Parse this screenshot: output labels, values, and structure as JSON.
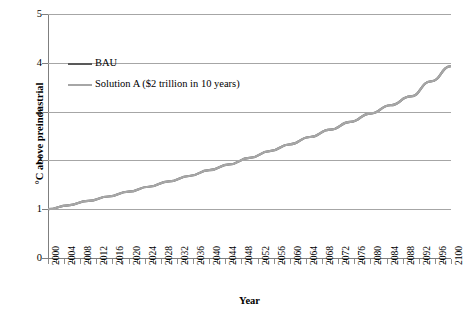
{
  "chart_data": {
    "type": "line",
    "title": "",
    "xlabel": "Year",
    "ylabel": "°C above preindustrial",
    "xlim": [
      2000,
      2100
    ],
    "ylim": [
      0,
      5
    ],
    "y_ticks": [
      "0",
      "1",
      "2",
      "3",
      "4",
      "5"
    ],
    "y_tick_values": [
      0,
      1,
      2,
      3,
      4,
      5
    ],
    "grid": "horizontal",
    "legend_position": "upper-left-inside",
    "x_tick_labels": [
      "2000",
      "2004",
      "2008",
      "2012",
      "2016",
      "2020",
      "2024",
      "2028",
      "2032",
      "2036",
      "2040",
      "2044",
      "2048",
      "2052",
      "2056",
      "2060",
      "2064",
      "2068",
      "2072",
      "2076",
      "2080",
      "2084",
      "2088",
      "2092",
      "2096",
      "2100"
    ],
    "x_tick_values": [
      2000,
      2004,
      2008,
      2012,
      2016,
      2020,
      2024,
      2028,
      2032,
      2036,
      2040,
      2044,
      2048,
      2052,
      2056,
      2060,
      2064,
      2068,
      2072,
      2076,
      2080,
      2084,
      2088,
      2092,
      2096,
      2100
    ],
    "x_minor_tick_step": 2,
    "x": [
      2000,
      2005,
      2010,
      2015,
      2020,
      2025,
      2030,
      2035,
      2040,
      2045,
      2050,
      2055,
      2060,
      2065,
      2070,
      2075,
      2080,
      2085,
      2090,
      2095,
      2100
    ],
    "series": [
      {
        "name": "BAU",
        "color": "#595959",
        "width": 2.2,
        "values": [
          1.0,
          1.08,
          1.17,
          1.26,
          1.36,
          1.46,
          1.57,
          1.68,
          1.8,
          1.92,
          2.05,
          2.19,
          2.33,
          2.48,
          2.63,
          2.79,
          2.96,
          3.13,
          3.31,
          3.62,
          3.93
        ]
      },
      {
        "name": "Solution A ($2 trillion in 10 years)",
        "color": "#a6a6a6",
        "width": 2.2,
        "values": [
          1.0,
          1.08,
          1.17,
          1.26,
          1.36,
          1.46,
          1.57,
          1.68,
          1.8,
          1.92,
          2.05,
          2.19,
          2.33,
          2.48,
          2.63,
          2.79,
          2.96,
          3.13,
          3.31,
          3.62,
          3.93
        ]
      }
    ]
  },
  "legend": {
    "items": [
      {
        "label": "BAU",
        "color": "#595959"
      },
      {
        "label": "Solution A ($2 trillion in 10 years)",
        "color": "#a6a6a6"
      }
    ]
  },
  "axes": {
    "x_title": "Year",
    "y_title": "°C above preindustrial"
  },
  "colors": {
    "background": "#ffffff",
    "gridline": "#a6a6a6",
    "axis": "#7f7f7f",
    "bau": "#595959",
    "solution_a": "#a6a6a6",
    "text": "#000000"
  }
}
